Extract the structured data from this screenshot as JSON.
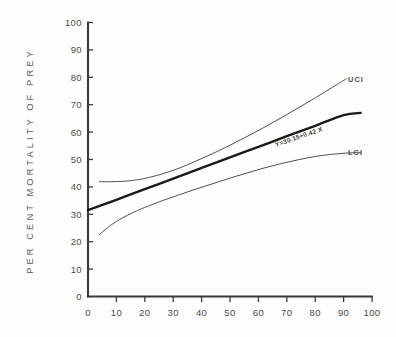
{
  "chart_data": {
    "type": "line",
    "title": "",
    "xlabel": "",
    "ylabel": "PER CENT MORTALITY OF PREY",
    "xlim": [
      0,
      100
    ],
    "ylim": [
      0,
      100
    ],
    "xticks": [
      0,
      10,
      20,
      30,
      40,
      50,
      60,
      70,
      80,
      90,
      100
    ],
    "yticks": [
      0,
      10,
      20,
      30,
      40,
      50,
      60,
      70,
      80,
      90,
      100
    ],
    "grid": false,
    "legend_position": "inline-right-of-curve-ends",
    "annotations": [
      {
        "name": "regression-equation",
        "text": "Y=30.15+0.42 X",
        "x": 63,
        "y": 57,
        "rotation": -19
      }
    ],
    "series": [
      {
        "name": "Regression line",
        "label": "Y=30.15+0.42 X",
        "style": "thick-solid",
        "color": "#1a1a1a",
        "x": [
          0,
          10,
          20,
          30,
          40,
          50,
          60,
          70,
          80,
          90,
          96
        ],
        "y": [
          31.5,
          35.3,
          39.2,
          43.0,
          46.9,
          50.8,
          54.6,
          58.5,
          62.3,
          66.2,
          67.0
        ]
      },
      {
        "name": "UCI",
        "label": "UCI",
        "style": "thin-solid",
        "color": "#4d4d58",
        "x": [
          4,
          8,
          12,
          16,
          20,
          26,
          32,
          38,
          44,
          50,
          56,
          62,
          68,
          74,
          80,
          86,
          91
        ],
        "y": [
          41.9,
          41.9,
          42.0,
          42.4,
          43.1,
          44.7,
          46.8,
          49.4,
          52.2,
          55.2,
          58.4,
          61.7,
          65.2,
          68.8,
          72.5,
          76.3,
          79.5
        ]
      },
      {
        "name": "LCI",
        "label": "LCI",
        "style": "thin-solid",
        "color": "#4d4d58",
        "x": [
          4,
          8,
          12,
          16,
          20,
          26,
          32,
          38,
          44,
          50,
          56,
          62,
          68,
          74,
          80,
          86,
          92,
          96
        ],
        "y": [
          22.6,
          26.0,
          28.6,
          30.7,
          32.5,
          34.9,
          37.1,
          39.2,
          41.2,
          43.2,
          45.1,
          46.9,
          48.5,
          49.9,
          51.1,
          51.9,
          52.4,
          52.5
        ]
      }
    ]
  },
  "axes": {
    "y_title": "PER CENT MORTALITY OF PREY",
    "y_tick_labels": [
      "100",
      "90",
      "80",
      "70",
      "60",
      "50",
      "40",
      "30",
      "20",
      "10",
      "0"
    ],
    "x_tick_labels": [
      "0",
      "10",
      "20",
      "30",
      "40",
      "50",
      "60",
      "70",
      "80",
      "90",
      "100"
    ]
  },
  "labels": {
    "uci": "UCI",
    "lci": "LCI",
    "equation": "Y=30.15+0.42 X"
  },
  "colors": {
    "background": "#fefefe",
    "axis": "#3a3a3a",
    "fit_line": "#1a1a1a",
    "ci_line": "#4d4d58",
    "text": "#4b4b4b"
  }
}
